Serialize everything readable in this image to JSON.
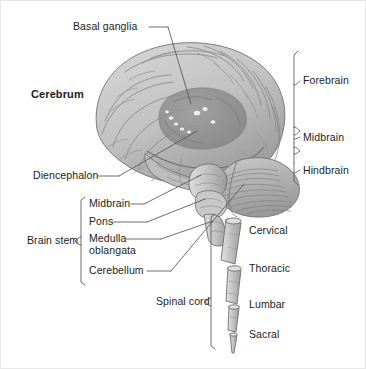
{
  "diagram": {
    "background_color": "#ffffff",
    "line_color": "#555555",
    "text_color": "#1b1b1b"
  },
  "labels": {
    "basal_ganglia": "Basal ganglia",
    "cerebrum": "Cerebrum",
    "diencephalon": "Diencephalon",
    "brain_stem": "Brain stem",
    "midbrain_stem": "Midbrain",
    "pons": "Pons",
    "medulla_line1": "Medulla",
    "medulla_line2": "oblangata",
    "cerebellum": "Cerebellum",
    "spinal_cord": "Spinal cord",
    "forebrain": "Forebrain",
    "midbrain": "Midbrain",
    "hindbrain": "Hindbrain",
    "cervical": "Cervical",
    "thoracic": "Thoracic",
    "lumbar": "Lumbar",
    "sacral": "Sacral"
  },
  "regions": {
    "divisions": [
      "Forebrain",
      "Midbrain",
      "Hindbrain"
    ],
    "brain_stem_parts": [
      "Midbrain",
      "Pons",
      "Medulla oblangata",
      "Cerebellum"
    ],
    "spinal_segments": [
      "Cervical",
      "Thoracic",
      "Lumbar",
      "Sacral"
    ]
  },
  "illustration": {
    "cerebrum_fill": "#c9c9c9",
    "cerebrum_shade": "#a8a8a8",
    "basal_ganglia_fill": "#8f8f8f",
    "cerebellum_fill": "#b4b4b4",
    "brainstem_fill": "#c0c0c0",
    "spinal_fill": "#c6c6c6"
  }
}
